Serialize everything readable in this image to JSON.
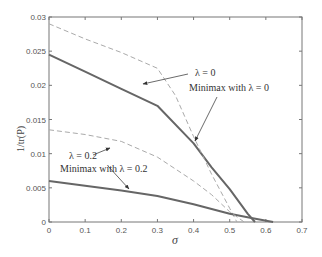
{
  "chart_data": {
    "type": "line",
    "title": "",
    "xlabel": "σ",
    "ylabel": "1/tr(P)",
    "xlim": [
      0,
      0.7
    ],
    "ylim": [
      0,
      0.03
    ],
    "grid": false,
    "legend": "none (inline annotations with arrows)",
    "xticks": [
      "0",
      "0.1",
      "0.2",
      "0.3",
      "0.4",
      "0.5",
      "0.6",
      "0.7"
    ],
    "yticks": [
      "0",
      "0.005",
      "0.01",
      "0.015",
      "0.02",
      "0.025",
      "0.03"
    ],
    "series": [
      {
        "name": "Minimax with λ = 0",
        "style": "solid",
        "color": "#666666",
        "x": [
          0,
          0.1,
          0.2,
          0.3,
          0.4,
          0.45,
          0.5,
          0.55,
          0.57
        ],
        "y": [
          0.0245,
          0.022,
          0.0195,
          0.017,
          0.0115,
          0.008,
          0.0048,
          0.0012,
          0.0
        ]
      },
      {
        "name": "λ = 0",
        "style": "dashed",
        "color": "#aaaaaa",
        "x": [
          0,
          0.1,
          0.2,
          0.3,
          0.35,
          0.4,
          0.45,
          0.5,
          0.52
        ],
        "y": [
          0.029,
          0.0268,
          0.0248,
          0.0225,
          0.0185,
          0.0125,
          0.007,
          0.002,
          0.0
        ]
      },
      {
        "name": "Minimax with λ = 0.2",
        "style": "solid",
        "color": "#666666",
        "x": [
          0,
          0.1,
          0.2,
          0.3,
          0.4,
          0.5,
          0.56,
          0.62
        ],
        "y": [
          0.006,
          0.0053,
          0.0046,
          0.0038,
          0.0026,
          0.0012,
          0.0006,
          0.0
        ]
      },
      {
        "name": "λ = 0.2",
        "style": "dashed",
        "color": "#aaaaaa",
        "x": [
          0,
          0.1,
          0.2,
          0.3,
          0.4,
          0.45,
          0.5,
          0.54
        ],
        "y": [
          0.0135,
          0.0128,
          0.0118,
          0.0095,
          0.006,
          0.004,
          0.0015,
          0.0
        ]
      }
    ],
    "annotations": [
      {
        "text": "λ = 0",
        "points_to": "λ = 0 dashed curve"
      },
      {
        "text": "Minimax with λ = 0",
        "points_to": "Minimax λ = 0 solid curve"
      },
      {
        "text": "λ = 0.2",
        "points_to": "λ = 0.2 dashed curve"
      },
      {
        "text": "Minimax with λ = 0.2",
        "points_to": "Minimax λ = 0.2 solid curve"
      }
    ]
  },
  "labels": {
    "xlabel": "σ",
    "ylabel": "1/tr(P)",
    "ann_l0": "λ = 0",
    "ann_mm0": "Minimax with λ = 0",
    "ann_l02": "λ = 0.2",
    "ann_mm02": "Minimax with λ = 0.2",
    "xticks": [
      "0",
      "0.1",
      "0.2",
      "0.3",
      "0.4",
      "0.5",
      "0.6",
      "0.7"
    ],
    "yticks": [
      "0",
      "0.005",
      "0.01",
      "0.015",
      "0.02",
      "0.025",
      "0.03"
    ]
  }
}
